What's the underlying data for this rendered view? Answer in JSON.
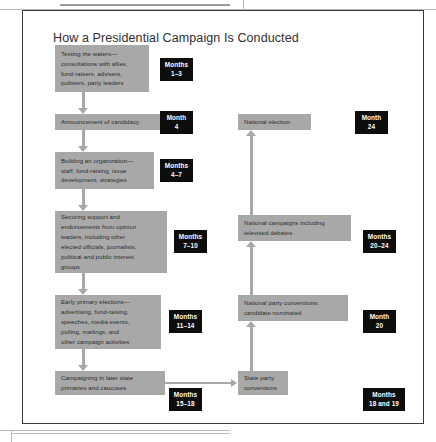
{
  "page_scan": {
    "ghost_header": ""
  },
  "figure": {
    "title": "How a Presidential Campaign Is Conducted",
    "left_column": [
      {
        "id": "testing-the-waters",
        "lines": [
          "Testing the waters—",
          "consultations with allies,",
          "fund-raisers, advisers,",
          "pollsters, party leaders"
        ],
        "badge": {
          "line1": "Months",
          "line2": "1–3"
        }
      },
      {
        "id": "announcement-of-candidacy",
        "lines": [
          "Announcement of candidacy"
        ],
        "badge": {
          "line1": "Month",
          "line2": "4"
        }
      },
      {
        "id": "building-an-organization",
        "lines": [
          "Building an organization—",
          "staff, fund-raising, issue",
          "development, strategies"
        ],
        "badge": {
          "line1": "Months",
          "line2": "4–7"
        }
      },
      {
        "id": "securing-support",
        "lines": [
          "Securing support and",
          "endorsements from opinion",
          "leaders, including other",
          "elected officials, journalists,",
          "political and public interest",
          "groups"
        ],
        "badge": {
          "line1": "Months",
          "line2": "7–10"
        }
      },
      {
        "id": "early-primary-elections",
        "lines": [
          "Early primary elections—",
          "advertising, fund-raising,",
          "speeches, media events,",
          "polling, mailings, and",
          "other campaign activities"
        ],
        "badge": {
          "line1": "Months",
          "line2": "11–14"
        }
      },
      {
        "id": "later-state-primaries",
        "lines": [
          "Campaigning in later state",
          "primaries and caucuses"
        ],
        "badge": {
          "line1": "Months",
          "line2": "15–18"
        }
      }
    ],
    "right_column": [
      {
        "id": "national-election",
        "lines": [
          "National election"
        ],
        "badge": {
          "line1": "Month",
          "line2": "24"
        }
      },
      {
        "id": "national-campaigns",
        "lines": [
          "National campaigns including",
          "televised debates"
        ],
        "badge": {
          "line1": "Months",
          "line2": "20–24"
        }
      },
      {
        "id": "national-party-conventions",
        "lines": [
          "National party conventions:",
          "candidate nominated"
        ],
        "badge": {
          "line1": "Month",
          "line2": "20"
        }
      },
      {
        "id": "state-party-conventions",
        "lines": [
          "State party",
          "conventions"
        ],
        "badge": {
          "line1": "Months",
          "line2": "18 and 19"
        }
      }
    ],
    "colors": {
      "box_fill": "#a8a8a8",
      "badge_fill": "#0d0d0d",
      "badge_text": "#ffffff",
      "frame_border": "#3a3a3a",
      "arrow": "#a8a8a8",
      "title_text": "#2f2f2f"
    }
  }
}
